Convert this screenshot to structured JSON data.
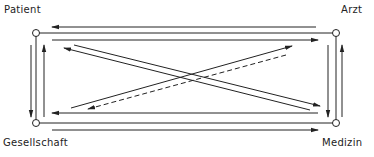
{
  "diagram": {
    "nodes": [
      {
        "id": "patient",
        "label": "Patient"
      },
      {
        "id": "arzt",
        "label": "Arzt"
      },
      {
        "id": "gesellschaft",
        "label": "Gesellschaft"
      },
      {
        "id": "medizin",
        "label": "Medizin"
      }
    ],
    "edges": [
      {
        "from": "arzt",
        "to": "patient",
        "style": "solid",
        "side": "top"
      },
      {
        "from": "patient",
        "to": "arzt",
        "style": "solid",
        "side": "top"
      },
      {
        "from": "patient",
        "to": "gesellschaft",
        "style": "solid",
        "side": "left"
      },
      {
        "from": "gesellschaft",
        "to": "patient",
        "style": "solid",
        "side": "left"
      },
      {
        "from": "arzt",
        "to": "medizin",
        "style": "solid",
        "side": "right"
      },
      {
        "from": "medizin",
        "to": "arzt",
        "style": "solid",
        "side": "right"
      },
      {
        "from": "medizin",
        "to": "gesellschaft",
        "style": "solid",
        "side": "bottom"
      },
      {
        "from": "gesellschaft",
        "to": "medizin",
        "style": "solid",
        "side": "bottom"
      },
      {
        "from": "medizin",
        "to": "patient",
        "style": "solid",
        "side": "diagonal"
      },
      {
        "from": "patient",
        "to": "medizin",
        "style": "solid",
        "side": "diagonal"
      },
      {
        "from": "gesellschaft",
        "to": "arzt",
        "style": "solid",
        "side": "diagonal"
      },
      {
        "from": "arzt",
        "to": "gesellschaft",
        "style": "dashed",
        "side": "diagonal"
      }
    ],
    "colors": {
      "line": "#222222",
      "background": "#ffffff"
    }
  }
}
